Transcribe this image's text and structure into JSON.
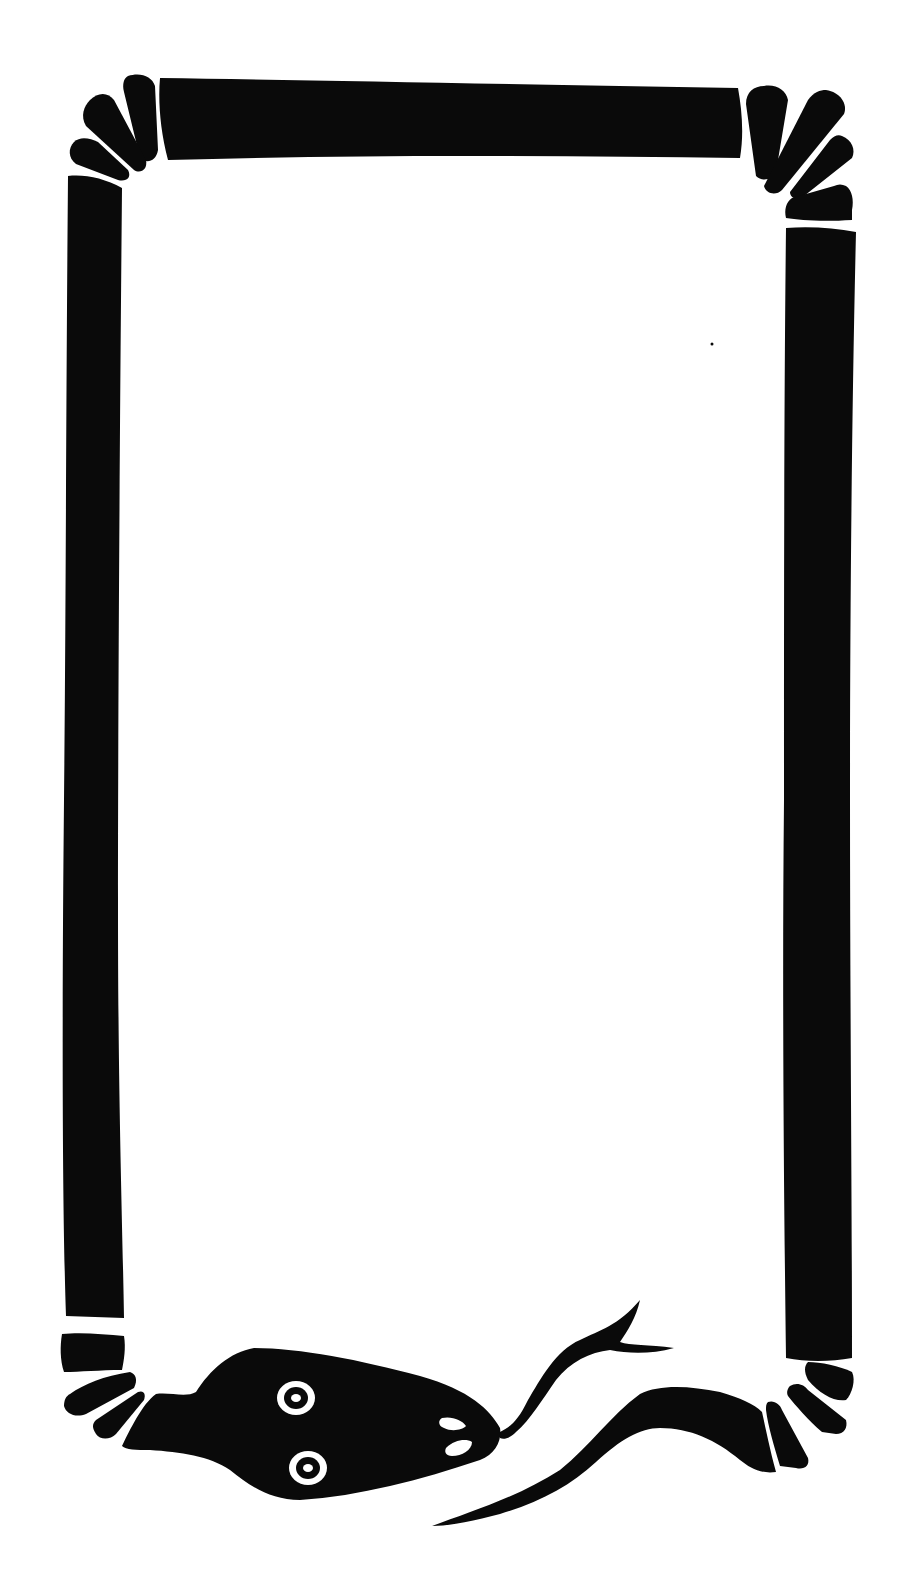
{
  "image": {
    "description": "Hand-drawn black snake forming a rectangular frame border",
    "colors": {
      "ink": "#0a0a0a",
      "paper": "#ffffff"
    },
    "frame": {
      "top_bar": {
        "x1": 160,
        "x2": 740,
        "y1": 78,
        "y2": 158
      },
      "left_bar": {
        "x": 65,
        "w": 52,
        "y1": 175,
        "y2": 1318
      },
      "right_bar": {
        "x": 782,
        "w": 54,
        "y1": 225,
        "y2": 1360
      }
    },
    "snake_head": {
      "position": "bottom-left",
      "eyes": 2,
      "nostrils": 2,
      "tongue": "forked"
    },
    "tail": {
      "position": "bottom-right"
    }
  }
}
